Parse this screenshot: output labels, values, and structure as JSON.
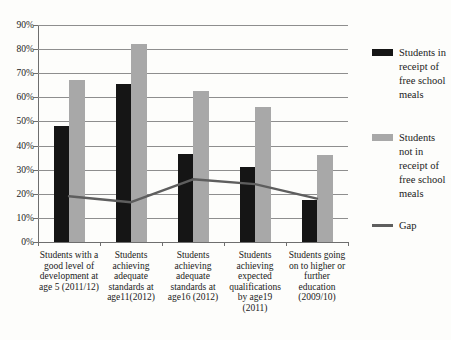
{
  "chart_data": {
    "type": "bar",
    "title": "",
    "categories": [
      "Students with a good level of development at age 5 (2011/12)",
      "Students achieving adequate standards at age11(2012)",
      "Students achieving adequate standards at age16 (2012)",
      "Students achieving expected qualifications by age19 (2011)",
      "Students going on to higher or further education (2009/10)"
    ],
    "series": [
      {
        "name": "Students in receipt of free school meals",
        "kind": "bar",
        "color": "#151515",
        "values": [
          48,
          65.5,
          36.5,
          31,
          17.5
        ]
      },
      {
        "name": "Students not in receipt of free school meals",
        "kind": "bar",
        "color": "#a8a8a8",
        "values": [
          67,
          82,
          62.5,
          56,
          36
        ]
      },
      {
        "name": "Gap",
        "kind": "line",
        "color": "#5e5e5e",
        "values": [
          19,
          16.5,
          26,
          24,
          18
        ]
      }
    ],
    "ylim": [
      0,
      90
    ],
    "ytick_step": 10,
    "yticks": [
      "90%",
      "80%",
      "70%",
      "60%",
      "50%",
      "40%",
      "30%",
      "20%",
      "10%",
      "0%"
    ],
    "grid": true,
    "legend_position": "right",
    "colors": {
      "gridline": "#8e8e8e",
      "axis": "#6e6e6e",
      "text": "#1a1a1a",
      "background": "#fdfdfb"
    }
  }
}
